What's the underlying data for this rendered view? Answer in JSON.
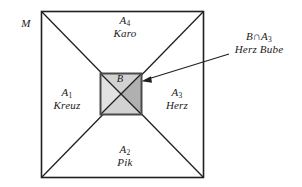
{
  "figure": {
    "type": "set-partition-venn-diagram",
    "universe_label": "M",
    "outer_square": {
      "x": 41,
      "y": 11,
      "width": 163,
      "height": 167
    },
    "inner_square": {
      "x": 100,
      "y": 73,
      "width": 41,
      "height": 42
    },
    "colors": {
      "stroke": "#231f20",
      "inner_light_fill": "#dcdcdc",
      "inner_dark_fill": "#b4b4b4",
      "inner_border": "#4d4d4d",
      "background": "#ffffff"
    }
  },
  "labels": {
    "universe": {
      "name": "M",
      "subscript": "",
      "desc": ""
    },
    "top": {
      "name": "A",
      "subscript": "4",
      "desc": "Karo"
    },
    "left": {
      "name": "A",
      "subscript": "1",
      "desc": "Kreuz"
    },
    "right": {
      "name": "A",
      "subscript": "3",
      "desc": "Herz"
    },
    "bottom": {
      "name": "A",
      "subscript": "2",
      "desc": "Pik"
    },
    "center": {
      "name": "B",
      "subscript": "",
      "desc": ""
    },
    "callout": {
      "name": "B∩A",
      "subscript": "3",
      "desc": "Herz Bube"
    }
  },
  "arrow": {
    "from_x": 229,
    "from_y": 54,
    "to_x": 143,
    "to_y": 81
  }
}
